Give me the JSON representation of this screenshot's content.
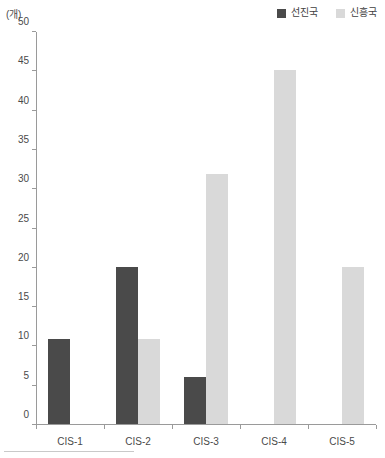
{
  "chart_data": {
    "type": "bar",
    "title": "",
    "subtitle": "",
    "xlabel": "",
    "ylabel": "(개)",
    "unit_label": "(개)",
    "categories": [
      "CIS-1",
      "CIS-2",
      "CIS-3",
      "CIS-4",
      "CIS-5"
    ],
    "series": [
      {
        "name": "선진국",
        "color": "#4a4a4a",
        "values": [
          10.8,
          20,
          6,
          0,
          0
        ]
      },
      {
        "name": "신흥국",
        "color": "#d9d9d9",
        "values": [
          0,
          10.8,
          31.8,
          45,
          20
        ]
      }
    ],
    "ylim": [
      0,
      50
    ],
    "ytick_labels": [
      "50",
      "45",
      "40",
      "35",
      "30",
      "25",
      "20",
      "15",
      "10",
      "5",
      "0"
    ],
    "ytick_values": [
      50,
      45,
      40,
      35,
      30,
      25,
      20,
      15,
      10,
      5,
      0
    ],
    "grid": false,
    "legend_position": "top-right"
  },
  "legend": {
    "entries": [
      {
        "label": "선진국",
        "color": "#4a4a4a"
      },
      {
        "label": "신흥국",
        "color": "#d9d9d9"
      }
    ]
  },
  "colors": {
    "advanced": "#4a4a4a",
    "emerging": "#d9d9d9",
    "axis": "#9a9a9a",
    "text": "#3f3f3f"
  }
}
